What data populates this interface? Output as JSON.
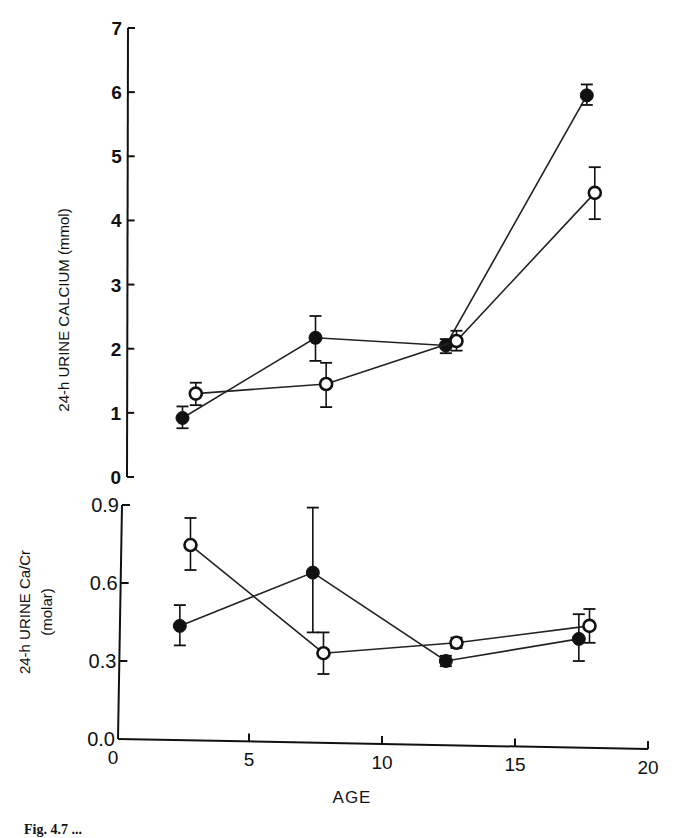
{
  "figure": {
    "caption_partial": "Fig. 4.7 ..."
  },
  "chart_data": [
    {
      "type": "line",
      "panel": "upper",
      "title": "",
      "xlabel": "AGE",
      "ylabel": "24-h URINE CALCIUM (mmol)",
      "xlim": [
        0,
        20
      ],
      "ylim": [
        0,
        7
      ],
      "yticks": [
        0,
        1,
        2,
        3,
        4,
        5,
        6,
        7
      ],
      "ytick_labels": [
        "0",
        "1",
        "2",
        "3",
        "4",
        "5",
        "6",
        "7"
      ],
      "grid": false,
      "legend": null,
      "series": [
        {
          "name": "filled circles",
          "marker": "filled-circle",
          "x": [
            2.5,
            7.5,
            12.4,
            17.7
          ],
          "values": [
            0.92,
            2.17,
            2.05,
            5.95
          ],
          "error_upper": [
            1.1,
            2.51,
            2.15,
            6.12
          ],
          "error_lower": [
            0.76,
            1.81,
            1.93,
            5.8
          ]
        },
        {
          "name": "open circles",
          "marker": "open-circle",
          "x": [
            3.0,
            7.9,
            12.8,
            18.0
          ],
          "values": [
            1.3,
            1.45,
            2.12,
            4.43
          ],
          "error_upper": [
            1.47,
            1.78,
            2.28,
            4.83
          ],
          "error_lower": [
            1.12,
            1.09,
            1.97,
            4.02
          ]
        }
      ]
    },
    {
      "type": "line",
      "panel": "lower",
      "title": "",
      "xlabel": "AGE",
      "ylabel": "24-h URINE Ca/Cr (molar)",
      "ylabel_lines": [
        "24-h URINE Ca/Cr",
        "(molar)"
      ],
      "xlim": [
        0,
        20
      ],
      "ylim": [
        0,
        0.9
      ],
      "xticks": [
        0,
        5,
        10,
        15,
        20
      ],
      "xtick_labels": [
        "0",
        "5",
        "10",
        "15",
        "20"
      ],
      "yticks": [
        0.0,
        0.3,
        0.6,
        0.9
      ],
      "ytick_labels": [
        "0.0",
        "0.3",
        "0.6",
        "0.9"
      ],
      "grid": false,
      "legend": null,
      "series": [
        {
          "name": "filled circles",
          "marker": "filled-circle",
          "x": [
            2.4,
            7.4,
            12.4,
            17.4
          ],
          "values": [
            0.435,
            0.64,
            0.3,
            0.385
          ],
          "error_upper": [
            0.515,
            0.89,
            0.32,
            0.48
          ],
          "error_lower": [
            0.36,
            0.41,
            0.28,
            0.3
          ]
        },
        {
          "name": "open circles",
          "marker": "open-circle",
          "x": [
            2.8,
            7.8,
            12.8,
            17.8
          ],
          "values": [
            0.746,
            0.33,
            0.37,
            0.435
          ],
          "error_upper": [
            0.85,
            0.41,
            0.39,
            0.5
          ],
          "error_lower": [
            0.65,
            0.25,
            0.35,
            0.37
          ]
        }
      ]
    }
  ]
}
